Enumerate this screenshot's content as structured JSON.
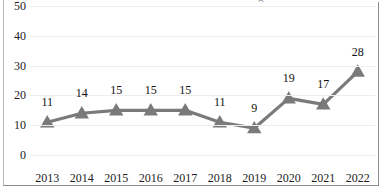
{
  "chart_data": {
    "type": "line",
    "title": "",
    "xlabel": "",
    "ylabel": "",
    "categories": [
      "2013",
      "2014",
      "2015",
      "2016",
      "2017",
      "2018",
      "2019",
      "2020",
      "2021",
      "2022"
    ],
    "values": [
      11,
      14,
      15,
      15,
      15,
      11,
      9,
      19,
      17,
      28
    ],
    "data_labels": [
      "11",
      "14",
      "15",
      "15",
      "15",
      "11",
      "9",
      "19",
      "17",
      "28"
    ],
    "ylim": [
      0,
      50
    ],
    "yticks": [
      0,
      10,
      20,
      30,
      40,
      50
    ],
    "ytick_labels": [
      "0",
      "10",
      "20",
      "30",
      "40",
      "50"
    ],
    "grid": "horizontal",
    "legend": "none",
    "series": [
      {
        "name": "",
        "values": [
          11,
          14,
          15,
          15,
          15,
          11,
          9,
          19,
          17,
          28
        ],
        "marker": "triangle-up",
        "line_color": "#7a7a7a",
        "marker_color": "#7a7a7a"
      }
    ]
  },
  "style": {
    "line_color": "#7a7a7a",
    "marker_color": "#7a7a7a",
    "grid_color": "#ededed",
    "border_color": "#8c8c8c",
    "text_color": "#1c1c1c",
    "background": "#ffffff"
  },
  "artifacts": {
    "clipped_title_fragment": "g"
  }
}
